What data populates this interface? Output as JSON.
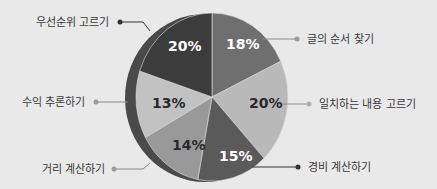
{
  "chart_data": {
    "type": "pie",
    "title": "",
    "categories": [
      "글의 순서 찾기",
      "일치하는 내용 고르기",
      "경비 계산하기",
      "거리 계산하기",
      "수익 추론하기",
      "우선순위 고르기"
    ],
    "values": [
      18,
      20,
      15,
      14,
      13,
      20
    ],
    "value_labels": [
      "18%",
      "20%",
      "15%",
      "14%",
      "13%",
      "20%"
    ],
    "start_angle": "12 o'clock",
    "direction": "clockwise",
    "style": "3D-tilted pie with left side edge, leader-line labels",
    "colors": [
      "#6f6f6f",
      "#b9b9b9",
      "#5a5a5a",
      "#999999",
      "#c2c2c2",
      "#3c3c3c"
    ],
    "label_text_colors": [
      "#ffffff",
      "#2a2a2a",
      "#ffffff",
      "#2a2a2a",
      "#2a2a2a",
      "#ffffff"
    ]
  },
  "labels": {
    "s0": "글의 순서 찾기",
    "s1": "일치하는 내용 고르기",
    "s2": "경비 계산하기",
    "s3": "거리 계산하기",
    "s4": "수익 추론하기",
    "s5": "우선순위 고르기"
  },
  "pcts": {
    "s0": "18%",
    "s1": "20%",
    "s2": "15%",
    "s3": "14%",
    "s4": "13%",
    "s5": "20%"
  }
}
